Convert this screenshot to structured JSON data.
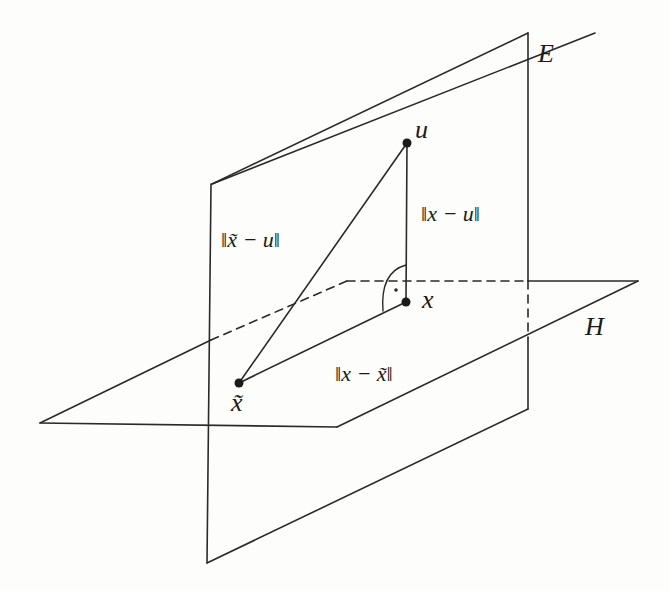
{
  "diagram": {
    "type": "geometric-projection",
    "colors": {
      "line": "#2a2a2a",
      "background": "#fdfdfc"
    },
    "planes": [
      {
        "id": "E",
        "label": "E",
        "orientation": "vertical"
      },
      {
        "id": "H",
        "label": "H",
        "orientation": "horizontal"
      }
    ],
    "points": [
      {
        "id": "u",
        "label": "u"
      },
      {
        "id": "x",
        "label": "x"
      },
      {
        "id": "x_tilde",
        "label": "x̃"
      }
    ],
    "segments": [
      {
        "from": "x_tilde",
        "to": "u",
        "label": "‖x̃ − u‖"
      },
      {
        "from": "x",
        "to": "u",
        "label": "‖x − u‖"
      },
      {
        "from": "x_tilde",
        "to": "x",
        "label": "‖x − x̃‖"
      }
    ],
    "right_angle_at": "x"
  }
}
